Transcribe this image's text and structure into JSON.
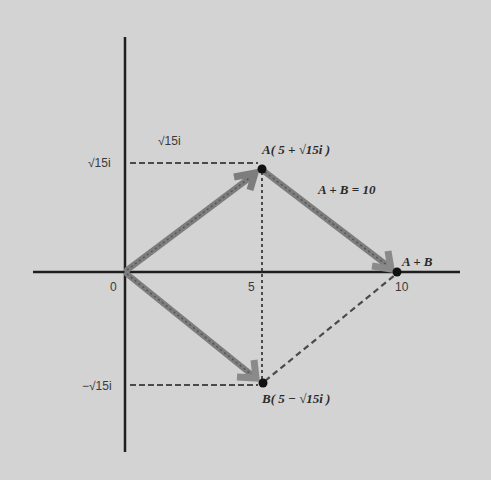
{
  "diagram": {
    "type": "complex-plane-vector-addition",
    "background_color": "#d3d3d3",
    "axis_color": "#1e1e1e",
    "vector_color": "#7d7d7d",
    "dashed_color": "#4a4a4a",
    "point_color": "#111111",
    "origin_label": "0",
    "x_ticks": [
      {
        "value": 5,
        "label": "5"
      },
      {
        "value": 10,
        "label": "10"
      }
    ],
    "y_ticks": [
      {
        "label": "√15i",
        "value": "sqrt15"
      },
      {
        "label": "−√15i",
        "value": "-sqrt15"
      }
    ],
    "floating_label": "√15i",
    "points": {
      "A": {
        "name": "A",
        "label": "A( 5 + √15i )",
        "re": 5,
        "im": "√15"
      },
      "B": {
        "name": "B",
        "label": "B( 5 − √15i )",
        "re": 5,
        "im": "−√15"
      },
      "sum": {
        "name": "A + B",
        "label": "A + B",
        "re": 10,
        "im": 0
      }
    },
    "annotation": "A + B = 10"
  },
  "labels": {
    "floating_sqrt15i": "√15i",
    "y_pos": "√15i",
    "y_neg": "−√15i",
    "origin": "0",
    "x5": "5",
    "x10": "10",
    "point_a": "A( 5 + √15i )",
    "point_b": "B( 5 − √15i )",
    "sum_point": "A + B",
    "equation": "A + B = 10"
  }
}
